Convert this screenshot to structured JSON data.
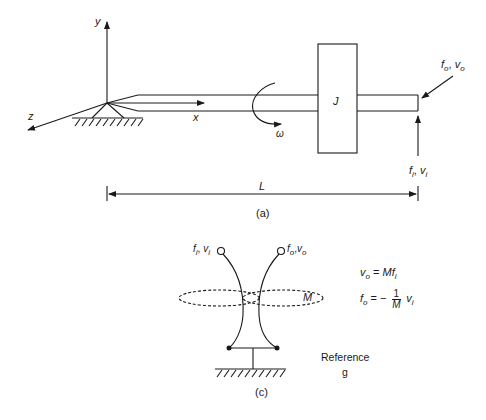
{
  "figure_a": {
    "caption": "(a)",
    "axes": {
      "x": "x",
      "y": "y",
      "z": "z"
    },
    "inertia_label": "J",
    "angular_velocity_label": "ω",
    "length_label": "L",
    "output_port": {
      "f": "f",
      "f_sub": "o",
      "v": "v",
      "v_sub": "o"
    },
    "input_port": {
      "f": "f",
      "f_sub": "i",
      "v": "v",
      "v_sub": "i"
    }
  },
  "figure_c": {
    "caption": "(c)",
    "input_port": {
      "f": "f",
      "f_sub": "i",
      "v": "v",
      "v_sub": "i"
    },
    "output_port": {
      "f": "f",
      "f_sub": "o",
      "v": "v",
      "v_sub": "o"
    },
    "coupling_label": "M",
    "reference_label": "Reference",
    "reference_symbol": "g",
    "equations": {
      "eq1": {
        "lhs": "v",
        "lhs_sub": "o",
        "eq": " = ",
        "rhs": "Mf",
        "rhs_sub": "i"
      },
      "eq2": {
        "lhs": "f",
        "lhs_sub": "o",
        "eq": " = − ",
        "num": "1",
        "den": "M",
        "rhs": "v",
        "rhs_sub": "i"
      }
    }
  },
  "colors": {
    "stroke": "#1a1a1a",
    "background": "#ffffff"
  }
}
